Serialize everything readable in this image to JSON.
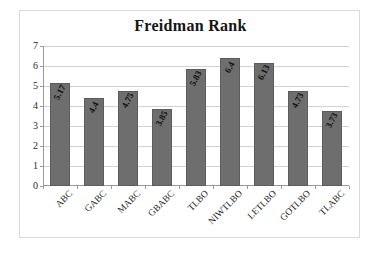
{
  "chart_data": {
    "type": "bar",
    "title": "Freidman Rank",
    "xlabel": "",
    "ylabel": "",
    "ylim": [
      0,
      7
    ],
    "yticks": [
      0,
      1,
      2,
      3,
      4,
      5,
      6,
      7
    ],
    "grid": true,
    "legend": "none",
    "bar_color": "#6e6e6e",
    "categories": [
      "ABC",
      "GABC",
      "MABC",
      "GBABC",
      "TLBO",
      "NIWTLBO",
      "LETLBO",
      "GOTLBO",
      "TLABC"
    ],
    "values": [
      5.17,
      4.4,
      4.75,
      3.85,
      5.83,
      6.4,
      6.13,
      4.73,
      3.73
    ],
    "value_labels": [
      "5.17",
      "4.4",
      "4.75",
      "3.85",
      "5.83",
      "6.4",
      "6.13",
      "4.73",
      "3.73"
    ]
  }
}
